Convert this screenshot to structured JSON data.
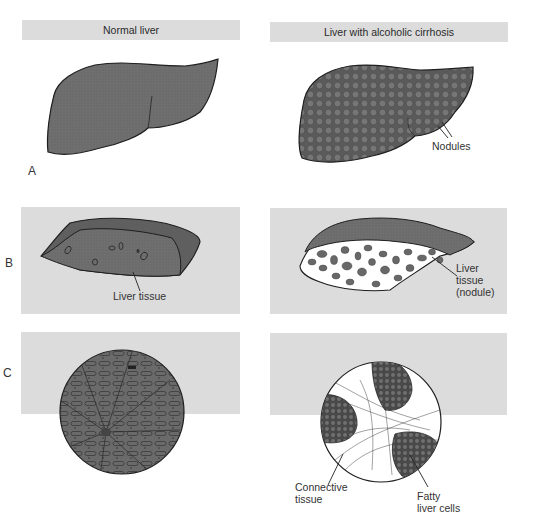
{
  "columns": {
    "left": {
      "title": "Normal liver"
    },
    "right": {
      "title": "Liver with alcoholic cirrhosis"
    }
  },
  "rows": [
    {
      "label": "A",
      "description": "Whole liver exterior"
    },
    {
      "label": "B",
      "description": "Cut section of liver"
    },
    {
      "label": "C",
      "description": "Microscopic tissue view"
    }
  ],
  "annotations": {
    "nodules": "Nodules",
    "liver_tissue": "Liver tissue",
    "liver_tissue_nodule_1": "Liver",
    "liver_tissue_nodule_2": "tissue",
    "liver_tissue_nodule_3": "(nodule)",
    "connective_tissue_1": "Connective",
    "connective_tissue_2": "tissue",
    "fatty_cells_1": "Fatty",
    "fatty_cells_2": "liver cells"
  },
  "colors": {
    "panel_bg": "#dcdcdc",
    "tissue": "#6e6e6e",
    "tissue_dark": "#555555",
    "outline": "#1e1e1e"
  }
}
